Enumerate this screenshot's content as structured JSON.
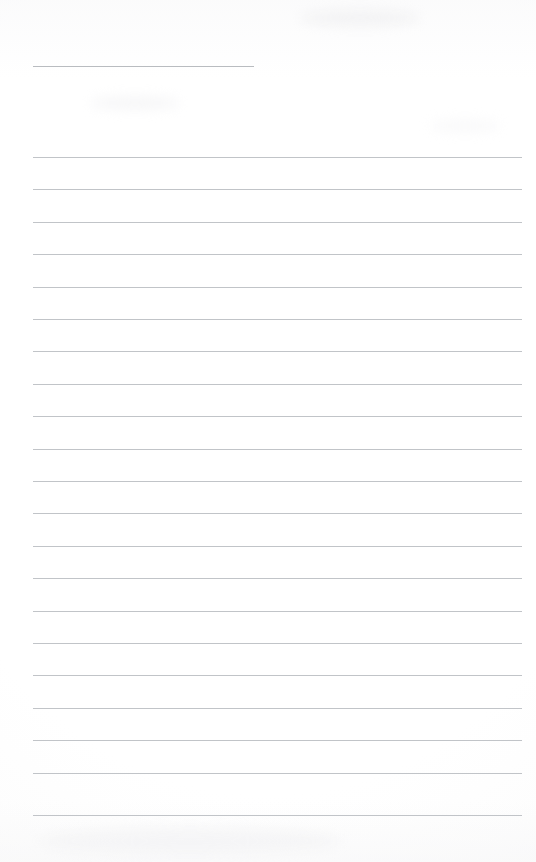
{
  "document": {
    "kind": "lined-writing-page",
    "title_text": "",
    "body_text": "",
    "page_background_color": "#fefefe",
    "rule_color": "#bcbfc3",
    "title_rule_color": "#b3b6bb",
    "page_width": 536,
    "page_height": 862
  },
  "title_rule": {
    "name": "title-rule",
    "x": 33,
    "y": 66,
    "width": 221,
    "thickness": 1
  },
  "body_rules": {
    "left": 33,
    "right": 522,
    "width": 489,
    "thickness": 1,
    "spacing": 32.4,
    "count": 21,
    "y_positions": [
      157.0,
      189.4,
      221.8,
      254.2,
      286.6,
      319.0,
      351.4,
      383.8,
      416.2,
      448.6,
      481.0,
      513.4,
      545.8,
      578.2,
      610.6,
      643.0,
      675.4,
      707.8,
      740.2,
      772.6,
      815.0
    ]
  },
  "smudges": [
    {
      "x": 300,
      "y": 10,
      "width": 120,
      "height": 16,
      "color": "rgba(236,236,238,0.55)"
    },
    {
      "x": 90,
      "y": 96,
      "width": 90,
      "height": 14,
      "color": "rgba(240,240,242,0.5)"
    },
    {
      "x": 40,
      "y": 828,
      "width": 300,
      "height": 26,
      "color": "rgba(242,242,244,0.6)"
    },
    {
      "x": 430,
      "y": 120,
      "width": 70,
      "height": 12,
      "color": "rgba(243,243,245,0.5)"
    }
  ]
}
